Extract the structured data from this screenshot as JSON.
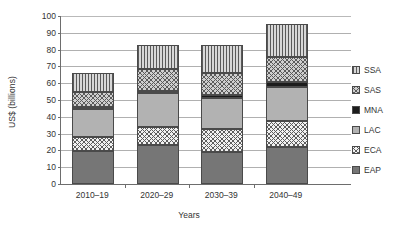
{
  "chart_data": {
    "type": "bar",
    "subtype": "stacked-bar",
    "title": "",
    "subtitle": "",
    "xlabel": "Years",
    "ylabel": "US$ (billions)",
    "categories": [
      "2010–19",
      "2020–29",
      "2030–39",
      "2040–49"
    ],
    "ylim": [
      0,
      100
    ],
    "yticks": [
      "100",
      "90",
      "80",
      "70",
      "60",
      "50",
      "40",
      "30",
      "20",
      "10",
      "0"
    ],
    "ytick_values": [
      100,
      90,
      80,
      70,
      60,
      50,
      40,
      30,
      20,
      10,
      0
    ],
    "grid": true,
    "grid_axis": "y",
    "legend_position": "right",
    "legend_order_top_to_bottom": [
      "SSA",
      "SAS",
      "MNA",
      "LAC",
      "ECA",
      "EAP"
    ],
    "stack_order_bottom_to_top": [
      "EAP",
      "ECA",
      "LAC",
      "MNA",
      "SAS",
      "SSA"
    ],
    "series": [
      {
        "name": "EAP",
        "pattern": "solid-dark-gray",
        "color": "#767676",
        "values": [
          19.5,
          23.5,
          19.0,
          22.0
        ]
      },
      {
        "name": "ECA",
        "pattern": "cross-hatch-light",
        "color": "#f2f2f2",
        "values": [
          8.5,
          10.5,
          14.0,
          15.5
        ]
      },
      {
        "name": "LAC",
        "pattern": "solid-light-gray",
        "color": "#b2b2b2",
        "values": [
          16.5,
          20.0,
          18.0,
          20.5
        ]
      },
      {
        "name": "MNA",
        "pattern": "solid-black",
        "color": "#1c1c1c",
        "values": [
          1.5,
          1.5,
          2.0,
          2.5
        ]
      },
      {
        "name": "SAS",
        "pattern": "cross-hatch-gray",
        "color": "#cfcfcf",
        "values": [
          9.0,
          13.0,
          13.0,
          15.0
        ]
      },
      {
        "name": "SSA",
        "pattern": "vertical-stripes",
        "color": "#d8d8d8",
        "values": [
          11.0,
          14.0,
          16.5,
          19.5
        ]
      }
    ],
    "totals": [
      66.0,
      82.5,
      82.5,
      95.0
    ]
  },
  "axes": {
    "y_title": "US$ (billions)",
    "x_title": "Years"
  },
  "legend": {
    "items": [
      {
        "label": "SSA",
        "swatch": "vertical-stripes-swatch"
      },
      {
        "label": "SAS",
        "swatch": "cross-hatch-gray-swatch"
      },
      {
        "label": "MNA",
        "swatch": "solid-black-swatch"
      },
      {
        "label": "LAC",
        "swatch": "solid-light-gray-swatch"
      },
      {
        "label": "ECA",
        "swatch": "cross-hatch-light-swatch"
      },
      {
        "label": "EAP",
        "swatch": "solid-dark-gray-swatch"
      }
    ]
  },
  "colors": {
    "eap": "#767676",
    "eca": "#f2f2f2",
    "lac": "#b2b2b2",
    "mna": "#1c1c1c",
    "sas": "#cfcfcf",
    "ssa": "#d8d8d8",
    "grid": "#b0b0b0",
    "axis": "#6d6d6d",
    "text": "#333333",
    "background": "#ffffff"
  }
}
